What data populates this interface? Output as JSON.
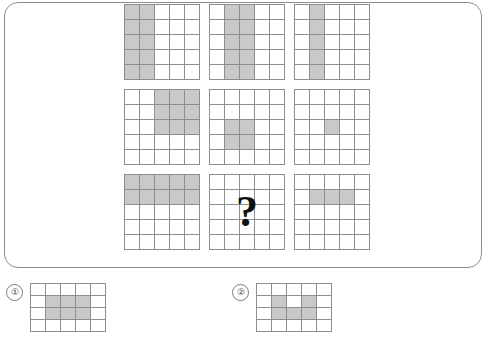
{
  "puzzle": {
    "type": "visual-matrix-reasoning",
    "grid_size": {
      "rows": 5,
      "cols": 5
    },
    "shade_color": "#c9c9c9",
    "line_color": "#8e8e8e",
    "frame_color": "#8d8d8d",
    "missing_marker": "?",
    "matrix": [
      {
        "id": "cell-r1c1",
        "label": "row1-col1",
        "shaded": [
          [
            1,
            1,
            0,
            0,
            0
          ],
          [
            1,
            1,
            0,
            0,
            0
          ],
          [
            1,
            1,
            0,
            0,
            0
          ],
          [
            1,
            1,
            0,
            0,
            0
          ],
          [
            1,
            1,
            0,
            0,
            0
          ]
        ]
      },
      {
        "id": "cell-r1c2",
        "label": "row1-col2",
        "shaded": [
          [
            0,
            1,
            1,
            0,
            0
          ],
          [
            0,
            1,
            1,
            0,
            0
          ],
          [
            0,
            1,
            1,
            0,
            0
          ],
          [
            0,
            1,
            1,
            0,
            0
          ],
          [
            0,
            1,
            1,
            0,
            0
          ]
        ]
      },
      {
        "id": "cell-r1c3",
        "label": "row1-col3",
        "shaded": [
          [
            0,
            1,
            0,
            0,
            0
          ],
          [
            0,
            1,
            0,
            0,
            0
          ],
          [
            0,
            1,
            0,
            0,
            0
          ],
          [
            0,
            1,
            0,
            0,
            0
          ],
          [
            0,
            1,
            0,
            0,
            0
          ]
        ]
      },
      {
        "id": "cell-r2c1",
        "label": "row2-col1",
        "shaded": [
          [
            0,
            0,
            1,
            1,
            1
          ],
          [
            0,
            0,
            1,
            1,
            1
          ],
          [
            0,
            0,
            1,
            1,
            1
          ],
          [
            0,
            0,
            0,
            0,
            0
          ],
          [
            0,
            0,
            0,
            0,
            0
          ]
        ]
      },
      {
        "id": "cell-r2c2",
        "label": "row2-col2",
        "shaded": [
          [
            0,
            0,
            0,
            0,
            0
          ],
          [
            0,
            0,
            0,
            0,
            0
          ],
          [
            0,
            1,
            1,
            0,
            0
          ],
          [
            0,
            1,
            1,
            0,
            0
          ],
          [
            0,
            0,
            0,
            0,
            0
          ]
        ]
      },
      {
        "id": "cell-r2c3",
        "label": "row2-col3",
        "shaded": [
          [
            0,
            0,
            0,
            0,
            0
          ],
          [
            0,
            0,
            0,
            0,
            0
          ],
          [
            0,
            0,
            1,
            0,
            0
          ],
          [
            0,
            0,
            0,
            0,
            0
          ],
          [
            0,
            0,
            0,
            0,
            0
          ]
        ]
      },
      {
        "id": "cell-r3c1",
        "label": "row3-col1",
        "shaded": [
          [
            1,
            1,
            1,
            1,
            1
          ],
          [
            1,
            1,
            1,
            1,
            1
          ],
          [
            0,
            0,
            0,
            0,
            0
          ],
          [
            0,
            0,
            0,
            0,
            0
          ],
          [
            0,
            0,
            0,
            0,
            0
          ]
        ]
      },
      {
        "id": "cell-r3c2",
        "label": "row3-col2-unknown",
        "is_question": true,
        "shaded": [
          [
            0,
            0,
            0,
            0,
            0
          ],
          [
            0,
            0,
            0,
            0,
            0
          ],
          [
            0,
            0,
            0,
            0,
            0
          ],
          [
            0,
            0,
            0,
            0,
            0
          ],
          [
            0,
            0,
            0,
            0,
            0
          ]
        ]
      },
      {
        "id": "cell-r3c3",
        "label": "row3-col3",
        "shaded": [
          [
            0,
            0,
            0,
            0,
            0
          ],
          [
            0,
            1,
            1,
            1,
            0
          ],
          [
            0,
            0,
            0,
            0,
            0
          ],
          [
            0,
            0,
            0,
            0,
            0
          ],
          [
            0,
            0,
            0,
            0,
            0
          ]
        ]
      }
    ],
    "options": [
      {
        "id": "option-1",
        "number": "①",
        "grid_size": {
          "rows": 4,
          "cols": 5
        },
        "shaded": [
          [
            0,
            0,
            0,
            0,
            0
          ],
          [
            0,
            1,
            1,
            1,
            0
          ],
          [
            0,
            1,
            1,
            1,
            0
          ],
          [
            0,
            0,
            0,
            0,
            0
          ]
        ]
      },
      {
        "id": "option-2",
        "number": "②",
        "grid_size": {
          "rows": 4,
          "cols": 5
        },
        "shaded": [
          [
            0,
            0,
            0,
            0,
            0
          ],
          [
            0,
            1,
            0,
            1,
            0
          ],
          [
            0,
            1,
            1,
            1,
            0
          ],
          [
            0,
            0,
            0,
            0,
            0
          ]
        ]
      }
    ]
  }
}
